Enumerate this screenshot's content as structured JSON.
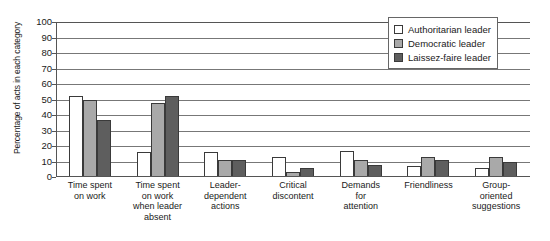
{
  "chart_data": {
    "type": "bar",
    "title": "",
    "xlabel": "",
    "ylabel": "Percentage of acts in each category",
    "ylim": [
      0,
      100
    ],
    "ytick_step": 10,
    "yticks": [
      "0",
      "10",
      "20",
      "30",
      "40",
      "50",
      "60",
      "70",
      "80",
      "90",
      "100"
    ],
    "grid": true,
    "legend_position": "top-right",
    "categories": [
      "Time spent on work",
      "Time spent on work when leader absent",
      "Leader-dependent actions",
      "Critical discontent",
      "Demands for attention",
      "Friendliness",
      "Group-oriented suggestions"
    ],
    "category_lines": [
      [
        "Time spent",
        "on work"
      ],
      [
        "Time spent",
        "on work",
        "when leader",
        "absent"
      ],
      [
        "Leader-",
        "dependent",
        "actions"
      ],
      [
        "Critical",
        "discontent"
      ],
      [
        "Demands",
        "for",
        "attention"
      ],
      [
        "Friendliness"
      ],
      [
        "Group-",
        "oriented",
        "suggestions"
      ]
    ],
    "series": [
      {
        "name": "Authoritarian leader",
        "color": "#ffffff",
        "values": [
          52,
          16,
          16,
          13,
          17,
          7,
          6
        ]
      },
      {
        "name": "Democratic leader",
        "color": "#a9a9a9",
        "values": [
          50,
          48,
          11,
          3,
          11,
          13,
          13
        ]
      },
      {
        "name": "Laissez-faire leader",
        "color": "#5e5e5e",
        "values": [
          37,
          52,
          11,
          6,
          8,
          11,
          10
        ]
      }
    ]
  },
  "legend": {
    "items": [
      {
        "label": "Authoritarian leader",
        "color": "#ffffff"
      },
      {
        "label": "Democratic leader",
        "color": "#a9a9a9"
      },
      {
        "label": "Laissez-faire leader",
        "color": "#5e5e5e"
      }
    ]
  }
}
